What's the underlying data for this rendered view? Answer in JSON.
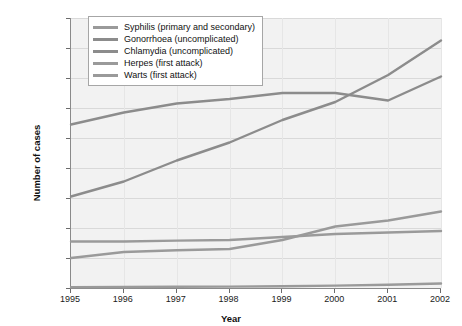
{
  "chart_data": {
    "type": "line",
    "title": "",
    "xlabel": "Year",
    "ylabel": "Number of cases",
    "x": [
      1995,
      1996,
      1997,
      1998,
      1999,
      2000,
      2001,
      2002
    ],
    "categories": [
      "1995",
      "1996",
      "1997",
      "1998",
      "1999",
      "2000",
      "2001",
      "2002"
    ],
    "xtick_labels": [
      "1995",
      "1996",
      "1997",
      "1998",
      "1999",
      "2000",
      "2001",
      "2002"
    ],
    "ytick_labels": [
      "0",
      "10 000",
      "20 000",
      "30 000",
      "40 000",
      "50 000",
      "60 000",
      "70 000",
      "80 000",
      "90 000"
    ],
    "ytick_values": [
      0,
      10000,
      20000,
      30000,
      40000,
      50000,
      60000,
      70000,
      80000,
      90000
    ],
    "ylim": [
      0,
      90000
    ],
    "xlim": [
      1995,
      2002
    ],
    "grid": "horizontal",
    "legend_position": "top-left",
    "series": [
      {
        "name": "Syphilis (primary and secondary)",
        "color": "#9a9a9a",
        "values": [
          300,
          350,
          400,
          450,
          600,
          800,
          1100,
          1500
        ]
      },
      {
        "name": "Gonorrhoea (uncomplicated)",
        "color": "#8c8c8c",
        "values": [
          54500,
          58500,
          61500,
          63000,
          65000,
          65000,
          62500,
          70500
        ]
      },
      {
        "name": "Chlamydia (uncomplicated)",
        "color": "#8c8c8c",
        "values": [
          30500,
          35500,
          42500,
          48500,
          56000,
          62000,
          71000,
          82500
        ]
      },
      {
        "name": "Herpes (first attack)",
        "color": "#9a9a9a",
        "values": [
          15500,
          15500,
          15800,
          16000,
          17000,
          18000,
          18500,
          19000
        ]
      },
      {
        "name": "Warts (first attack)",
        "color": "#9a9a9a",
        "values": [
          10000,
          12000,
          12600,
          13000,
          16000,
          20500,
          22500,
          25500
        ]
      }
    ]
  },
  "legend": {
    "items": [
      {
        "label": "Syphilis (primary and secondary)",
        "color": "#9a9a9a"
      },
      {
        "label": "Gonorrhoea (uncomplicated)",
        "color": "#8c8c8c"
      },
      {
        "label": "Chlamydia (uncomplicated)",
        "color": "#8c8c8c"
      },
      {
        "label": "Herpes (first attack)",
        "color": "#9a9a9a"
      },
      {
        "label": "Warts (first attack)",
        "color": "#9a9a9a"
      }
    ]
  },
  "axes": {
    "x_title": "Year",
    "y_title": "Number of cases"
  },
  "colors": {
    "plot_background": "#f2f2f2",
    "grid": "#d9d9d9",
    "axis": "#8a8a8a",
    "text": "#111111"
  }
}
